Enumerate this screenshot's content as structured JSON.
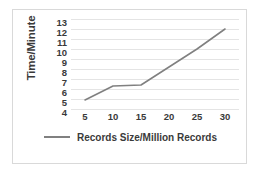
{
  "chart_data": {
    "type": "line",
    "title": "",
    "xlabel": "",
    "ylabel": "Time/Minute",
    "x": [
      5,
      10,
      15,
      20,
      25,
      30
    ],
    "xticks": [
      "5",
      "10",
      "15",
      "20",
      "25",
      "30"
    ],
    "yticks": [
      "13",
      "12",
      "11",
      "10",
      "9",
      "8",
      "7",
      "6",
      "5",
      "4"
    ],
    "xlim": [
      2.5,
      32.5
    ],
    "ylim": [
      4,
      13
    ],
    "grid": true,
    "legend_position": "bottom",
    "series": [
      {
        "name": "Records Size/Million Records",
        "color": "#808080",
        "values": [
          4.9,
          6.3,
          6.4,
          8.2,
          10.0,
          12.0
        ]
      }
    ]
  },
  "colors": {
    "series_line": "#808080",
    "gridline": "#e4e4e4",
    "card_border": "#d9d9d9",
    "text": "#3a3a3a",
    "background": "#ffffff"
  },
  "legend": {
    "label": "Records Size/Million Records"
  }
}
